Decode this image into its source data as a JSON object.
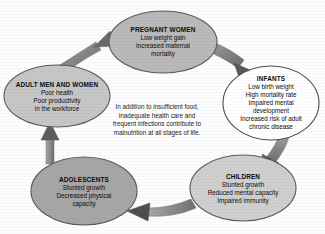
{
  "diagram": {
    "background_color": "#fdfdfd",
    "center_note": {
      "lines": [
        "In addition to insufficient food,",
        "inadequate health care and",
        "frequent infections contribute to",
        "malnutrition at all stages of life."
      ]
    },
    "nodes": [
      {
        "id": "pregnant-women",
        "title": "PREGNANT WOMEN",
        "lines": [
          "Low weight gain",
          "Increased maternal",
          "mortality"
        ],
        "fill": "#b9b9b9",
        "stroke": "#5a5a5a"
      },
      {
        "id": "infants",
        "title": "INFANTS",
        "lines": [
          "Low birth weight",
          "High mortality rate",
          "Impaired mental",
          "development",
          "Increased risk of adult",
          "chronic disease"
        ],
        "fill": "#ffffff",
        "stroke": "#4f4f4f"
      },
      {
        "id": "children",
        "title": "CHILDREN",
        "lines": [
          "Stunted growth",
          "Reduced mental capacity",
          "Impaired immunity"
        ],
        "fill": "#cfcfcf",
        "stroke": "#5a5a5a"
      },
      {
        "id": "adolescents",
        "title": "ADOLESCENTS",
        "lines": [
          "Stunted growth",
          "Decreased physical",
          "capacity"
        ],
        "fill": "#a6a6a6",
        "stroke": "#585858"
      },
      {
        "id": "adult-men-and-women",
        "title": "ADULT MEN AND WOMEN",
        "lines": [
          "Poor health",
          "Poor productivity",
          "in the workforce"
        ],
        "fill": "#c6c6c6",
        "stroke": "#5a5a5a"
      }
    ],
    "arrows": [
      {
        "id": "adults-to-pregnant",
        "from": "adult-men-and-women",
        "to": "pregnant-women",
        "color": "#8b8b8b"
      },
      {
        "id": "pregnant-to-infants",
        "from": "pregnant-women",
        "to": "infants",
        "color": "#8b8b8b"
      },
      {
        "id": "infants-to-children",
        "from": "infants",
        "to": "children",
        "color": "#8b8b8b"
      },
      {
        "id": "children-to-adolescents",
        "from": "children",
        "to": "adolescents",
        "color": "#8b8b8b"
      },
      {
        "id": "adolescents-to-adults",
        "from": "adolescents",
        "to": "adult-men-and-women",
        "color": "#8b8b8b"
      }
    ]
  }
}
